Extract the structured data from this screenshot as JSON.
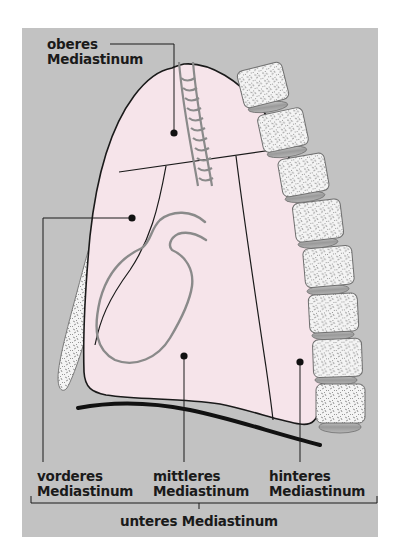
{
  "figure": {
    "colors": {
      "background": "#c2c2c2",
      "mediastinum_fill": "#f6e4ea",
      "outline": "#1a1a1a",
      "heart_trachea": "#8a8a8a",
      "bone": "#f4f4f4",
      "intervertebral_disc": "#a6a6a6"
    }
  },
  "labels": {
    "oberes": {
      "line1": "oberes",
      "line2": "Mediastinum"
    },
    "vorderes": {
      "line1": "vorderes",
      "line2": "Mediastinum"
    },
    "mittleres": {
      "line1": "mittleres",
      "line2": "Mediastinum"
    },
    "hinteres": {
      "line1": "hinteres",
      "line2": "Mediastinum"
    },
    "unteres": {
      "text": "unteres Mediastinum"
    }
  },
  "structures": [
    {
      "name": "Sternum",
      "icon": "sternum-shape"
    },
    {
      "name": "Wirbelsäule",
      "icon": "vertebra-shape",
      "vertebrae_count": 8
    },
    {
      "name": "Trachea",
      "icon": "trachea-shape"
    },
    {
      "name": "Herz",
      "icon": "heart-outline"
    },
    {
      "name": "Zwerchfell",
      "icon": "diaphragm-line"
    }
  ]
}
